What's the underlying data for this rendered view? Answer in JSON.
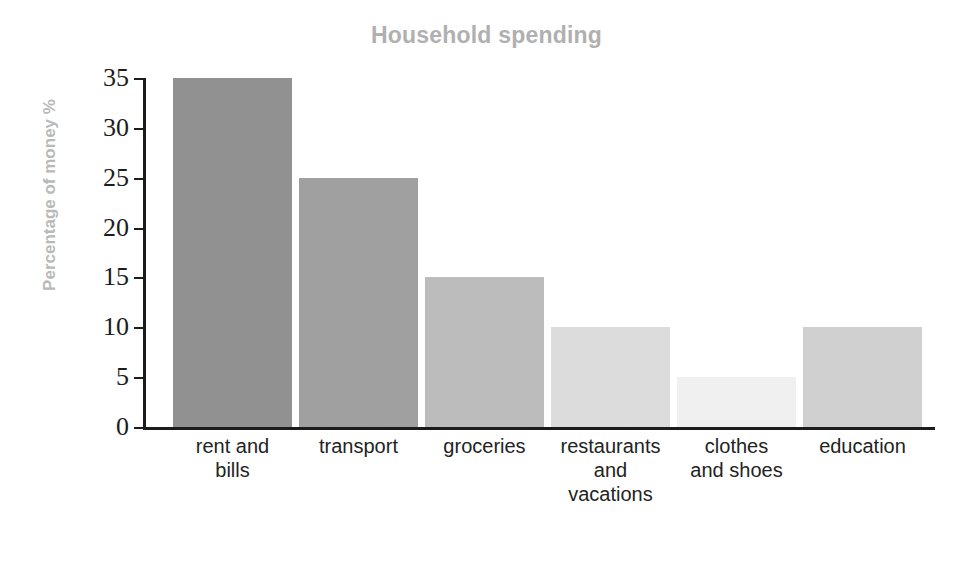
{
  "chart_data": {
    "type": "bar",
    "title": "Household spending",
    "xlabel": "Items",
    "ylabel": "Percentage of money %",
    "categories": [
      "rent and bills",
      "transport",
      "groceries",
      "restaurants and vacations",
      "clothes and shoes",
      "education"
    ],
    "values": [
      35,
      25,
      15,
      10,
      5,
      10
    ],
    "bar_colors": [
      "#919191",
      "#a0a0a0",
      "#bcbcbc",
      "#dcdcdc",
      "#f0f0f0",
      "#d0d0d0"
    ],
    "ylim": [
      0,
      35
    ],
    "yticks": [
      0,
      5,
      10,
      15,
      20,
      25,
      30,
      35
    ],
    "ytick_labels": [
      "0",
      "5",
      "10",
      "15",
      "20",
      "25",
      "30",
      "35"
    ],
    "grid": false,
    "legend": null,
    "axis_color": "#1c1c1c",
    "title_color": "#b0b0b0",
    "axis_label_color": "#b9b9b9",
    "tick_label_color": "#1c1c1c",
    "category_label_color": "#232323"
  },
  "category_lines": [
    [
      "rent and",
      "bills"
    ],
    [
      "transport"
    ],
    [
      "groceries"
    ],
    [
      "restaurants",
      "and",
      "vacations"
    ],
    [
      "clothes",
      "and shoes"
    ],
    [
      "education"
    ]
  ]
}
